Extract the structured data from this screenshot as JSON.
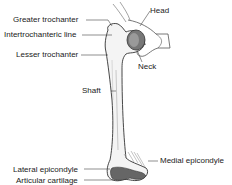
{
  "diagram": {
    "labels": {
      "head": "Head",
      "greater_trochanter": "Greater trochanter",
      "intertrochanteric_line": "Intertrochanteric line",
      "neck": "Neck",
      "lesser_trochanter": "Lesser trochanter",
      "shaft": "Shaft",
      "medial_epicondyle": "Medial epicondyle",
      "lateral_epicondyle": "Lateral epicondyle",
      "articular_cartilage": "Articular cartilage"
    },
    "colors": {
      "bone_fill": "#f4f4f4",
      "outline": "#333333",
      "cartilage": "#555555",
      "leader": "#444444"
    }
  }
}
